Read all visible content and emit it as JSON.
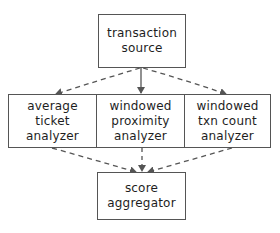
{
  "diagram": {
    "style": "hand-drawn flowchart",
    "colors": {
      "stroke": "#555555",
      "text": "#1e1e1e",
      "background": "#ffffff"
    },
    "nodes": {
      "source": {
        "lines": [
          "transaction",
          "source"
        ]
      },
      "avg": {
        "lines": [
          "average",
          "ticket",
          "analyzer"
        ]
      },
      "prox": {
        "lines": [
          "windowed",
          "proximity",
          "analyzer"
        ]
      },
      "count": {
        "lines": [
          "windowed",
          "txn count",
          "analyzer"
        ]
      },
      "agg": {
        "lines": [
          "score",
          "aggregator"
        ]
      }
    },
    "edges": [
      {
        "from": "transaction source",
        "to": "average ticket analyzer",
        "style": "dashed"
      },
      {
        "from": "transaction source",
        "to": "windowed proximity analyzer",
        "style": "solid"
      },
      {
        "from": "transaction source",
        "to": "windowed txn count analyzer",
        "style": "dashed"
      },
      {
        "from": "average ticket analyzer",
        "to": "score aggregator",
        "style": "dashed"
      },
      {
        "from": "windowed proximity analyzer",
        "to": "score aggregator",
        "style": "dashed"
      },
      {
        "from": "windowed txn count analyzer",
        "to": "score aggregator",
        "style": "dashed"
      }
    ]
  }
}
